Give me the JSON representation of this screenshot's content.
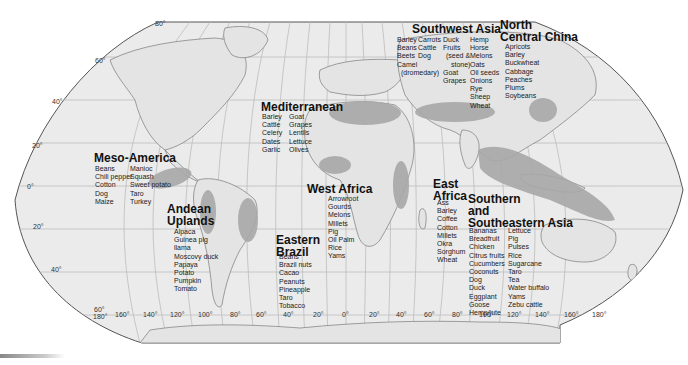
{
  "map": {
    "title": "Centers of plant and animal domestication",
    "colors": {
      "ocean_bg": "#ebebeb",
      "land": "#e4e4e4",
      "hearth": "#a8a8a8",
      "grid": "#bdbdbd",
      "border": "#777777"
    },
    "latitude_labels": [
      "80°",
      "60°",
      "40°",
      "20°",
      "0°",
      "20°",
      "40°",
      "60°"
    ],
    "longitude_labels": [
      "180°",
      "160°",
      "140°",
      "120°",
      "100°",
      "80°",
      "60°",
      "40°",
      "20°",
      "0°",
      "20°",
      "40°",
      "60°",
      "80°",
      "100°",
      "120°",
      "140°",
      "160°",
      "180°"
    ]
  },
  "regions": [
    {
      "name": "Meso-America",
      "items_col1": [
        "Beans",
        "Chili pepper",
        "Cotton",
        "Dog",
        "Maize"
      ],
      "items_col2": [
        "Manioc",
        "Squash",
        "Sweet potato",
        "Taro",
        "Turkey"
      ]
    },
    {
      "name_line1": "Andean",
      "name_line2": "Uplands",
      "items_col1": [
        "Alpaca",
        "Guinea pig",
        "llama",
        "Moscovy duck",
        "Papaya",
        "Potato",
        "Pumpkin",
        "Tomato"
      ]
    },
    {
      "name_line1": "Eastern",
      "name_line2": "Brazil",
      "items_col1": [
        "Beans",
        "Brazil nuts",
        "Cacao",
        "Peanuts",
        "Pineapple",
        "Taro",
        "Tobacco"
      ]
    },
    {
      "name": "Mediterranean",
      "items_col1": [
        "Barley",
        "Cattle",
        "Celery",
        "Dates",
        "Garlic"
      ],
      "items_col2": [
        "Goat",
        "Grapes",
        "Lentils",
        "Lettuce",
        "Olives"
      ]
    },
    {
      "name": "West Africa",
      "items_col1": [
        "Arrowroot",
        "Gourds",
        "Melons",
        "Millets",
        "Pig",
        "Oil Palm",
        "Rice",
        "Yams"
      ]
    },
    {
      "name_line1": "East",
      "name_line2": "Africa",
      "items_col1": [
        "Ass",
        "Barley",
        "Coffee",
        "Cotton",
        "Millets",
        "Okra",
        "Sorghum",
        "Wheat"
      ]
    },
    {
      "name": "Southwest Asia",
      "items_col1": [
        "Barley",
        "Beans",
        "Beets",
        "Camel",
        "(dromedary)"
      ],
      "items_col2": [
        "Carrots",
        "Cattle",
        "Dog"
      ],
      "items_col3": [
        "Duck",
        "Fruits",
        "(seed &",
        "stone)",
        "Goat",
        "Grapes"
      ],
      "items_col4": [
        "Hemp",
        "Horse",
        "Melons",
        "Oats",
        "Oil seeds",
        "Onions",
        "Rye",
        "Sheep",
        "Wheat"
      ]
    },
    {
      "name_line1": "North",
      "name_line2": "Central China",
      "items_col1": [
        "Apricots",
        "Barley",
        "Buckwheat",
        "Cabbage",
        "Peaches",
        "Plums",
        "Soybeans"
      ]
    },
    {
      "name_line1": "Southern",
      "name_line2": "and",
      "name_line3": "Southeastern Asia",
      "items_col1": [
        "Bananas",
        "Breadfruit",
        "Chicken",
        "Citrus fruits",
        "Cucumbers",
        "Coconuts",
        "Dog",
        "Duck",
        "Eggplant",
        "Goose",
        "Hemp/jute"
      ],
      "items_col2": [
        "Lettuce",
        "Pig",
        "Pulses",
        "Rice",
        "Sugarcane",
        "Taro",
        "Tea",
        "Water buffalo",
        "Yams",
        "Zebu cattle"
      ]
    }
  ]
}
